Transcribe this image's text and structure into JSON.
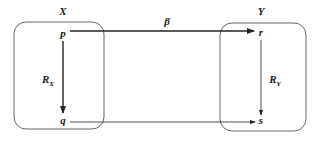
{
  "diagram": {
    "sets": [
      {
        "id": "X",
        "label": "X"
      },
      {
        "id": "Y",
        "label": "Y"
      }
    ],
    "nodes": [
      {
        "id": "p",
        "label": "p",
        "set": "X"
      },
      {
        "id": "q",
        "label": "q",
        "set": "X"
      },
      {
        "id": "r",
        "label": "r",
        "set": "Y"
      },
      {
        "id": "s",
        "label": "s",
        "set": "Y"
      }
    ],
    "edges": [
      {
        "from": "p",
        "to": "r",
        "label": "β",
        "style": "thick"
      },
      {
        "from": "p",
        "to": "q",
        "label": "R",
        "subscript": "X",
        "style": "thick"
      },
      {
        "from": "r",
        "to": "s",
        "label": "R",
        "subscript": "Y",
        "style": "thin"
      },
      {
        "from": "q",
        "to": "s",
        "label": "",
        "style": "thin"
      }
    ],
    "colors": {
      "line": "#222222",
      "box": "#555555",
      "background": "#ffffff"
    }
  }
}
